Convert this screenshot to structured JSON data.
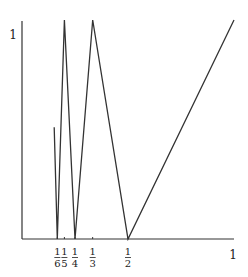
{
  "chart_data": {
    "type": "line",
    "title": "",
    "xlabel": "",
    "ylabel": "",
    "xlim": [
      0,
      1
    ],
    "ylim": [
      0,
      1
    ],
    "grid": false,
    "legend": null,
    "x_ticks": [
      {
        "value": 0.16667,
        "num": "1",
        "den": "6"
      },
      {
        "value": 0.2,
        "num": "1",
        "den": "5"
      },
      {
        "value": 0.25,
        "num": "1",
        "den": "4"
      },
      {
        "value": 0.33333,
        "num": "1",
        "den": "3"
      },
      {
        "value": 0.5,
        "num": "1",
        "den": "2"
      }
    ],
    "x_end_label": "1",
    "y_top_label": "1",
    "series": [
      {
        "name": "f(x)",
        "x": [
          0.152,
          0.16667,
          0.2,
          0.25,
          0.33333,
          0.5,
          1.0
        ],
        "y": [
          0.51,
          0,
          1,
          0,
          1,
          0,
          1
        ]
      }
    ],
    "line_color": "#333333",
    "axis_color": "#333333"
  }
}
